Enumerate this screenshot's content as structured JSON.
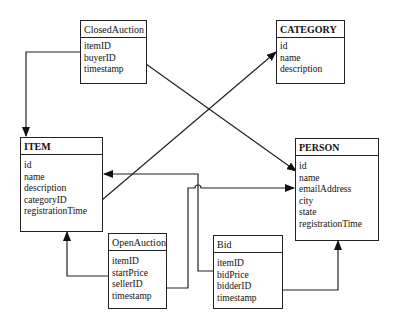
{
  "diagram": {
    "type": "entity-relationship",
    "entities": {
      "closed_auction": {
        "title": "ClosedAuction",
        "attributes": [
          "itemID",
          "buyerID",
          "timestamp"
        ]
      },
      "category": {
        "title": "CATEGORY",
        "attributes": [
          "id",
          "name",
          "description"
        ]
      },
      "item": {
        "title": "ITEM",
        "attributes": [
          "id",
          "name",
          "description",
          "categoryID",
          "registrationTime"
        ]
      },
      "person": {
        "title": "PERSON",
        "attributes": [
          "id",
          "name",
          "emailAddress",
          "city",
          "state",
          "registrationTime"
        ]
      },
      "open_auction": {
        "title": "OpenAuction",
        "attributes": [
          "itemID",
          "startPrice",
          "sellerID",
          "timestamp"
        ]
      },
      "bid": {
        "title": "Bid",
        "attributes": [
          "itemID",
          "bidPrice",
          "bidderID",
          "timestamp"
        ]
      }
    },
    "relationships": [
      {
        "from": "ClosedAuction.itemID",
        "to": "ITEM"
      },
      {
        "from": "ClosedAuction.buyerID",
        "to": "PERSON.id"
      },
      {
        "from": "ITEM.categoryID",
        "to": "CATEGORY.id"
      },
      {
        "from": "OpenAuction.itemID",
        "to": "ITEM"
      },
      {
        "from": "OpenAuction.sellerID",
        "to": "PERSON.name"
      },
      {
        "from": "Bid.itemID",
        "to": "ITEM.id"
      },
      {
        "from": "Bid.bidderID",
        "to": "PERSON"
      }
    ],
    "colors": {
      "line": "#222222",
      "background": "#ffffff"
    }
  }
}
